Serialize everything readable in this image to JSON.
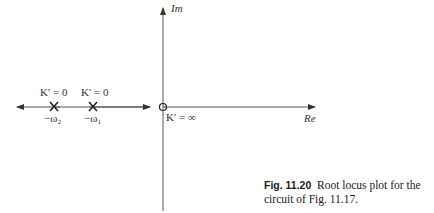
{
  "diagram": {
    "type": "root-locus",
    "axes": {
      "vertical_label": "Im",
      "horizontal_label": "Re"
    },
    "poles": [
      {
        "gain_label": "K′ = 0",
        "location_label": "−ω₂"
      },
      {
        "gain_label": "K′ = 0",
        "location_label": "−ω₁"
      }
    ],
    "zero": {
      "gain_label": "K′ = ∞"
    }
  },
  "caption": {
    "fig_number": "Fig. 11.20",
    "text": "Root locus plot for the circuit of Fig. 11.17."
  }
}
